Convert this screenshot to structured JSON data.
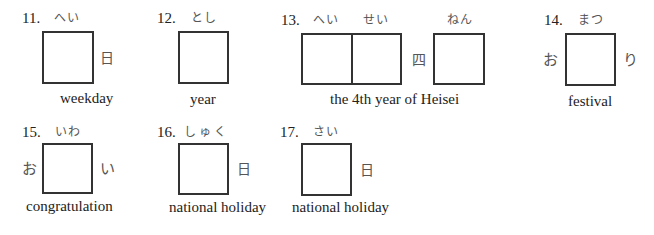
{
  "items": [
    {
      "number": "11.",
      "reading": "へい",
      "prefix": "",
      "suffix": "日",
      "caption": "weekday"
    },
    {
      "number": "12.",
      "reading": "とし",
      "prefix": "",
      "suffix": "",
      "caption": "year"
    },
    {
      "number": "13.",
      "reading": "へい",
      "reading2": "せい",
      "middle": "四",
      "reading3": "ねん",
      "caption": "the 4th year of Heisei"
    },
    {
      "number": "14.",
      "reading": "まつ",
      "prefix": "お",
      "suffix": "り",
      "caption": "festival"
    },
    {
      "number": "15.",
      "reading": "いわ",
      "prefix": "お",
      "suffix": "い",
      "caption": "congratulation"
    },
    {
      "number": "16.",
      "reading": "しゅく",
      "prefix": "",
      "suffix": "日",
      "caption": "national holiday"
    },
    {
      "number": "17.",
      "reading": "さい",
      "prefix": "",
      "suffix": "日",
      "caption": "national holiday"
    }
  ]
}
